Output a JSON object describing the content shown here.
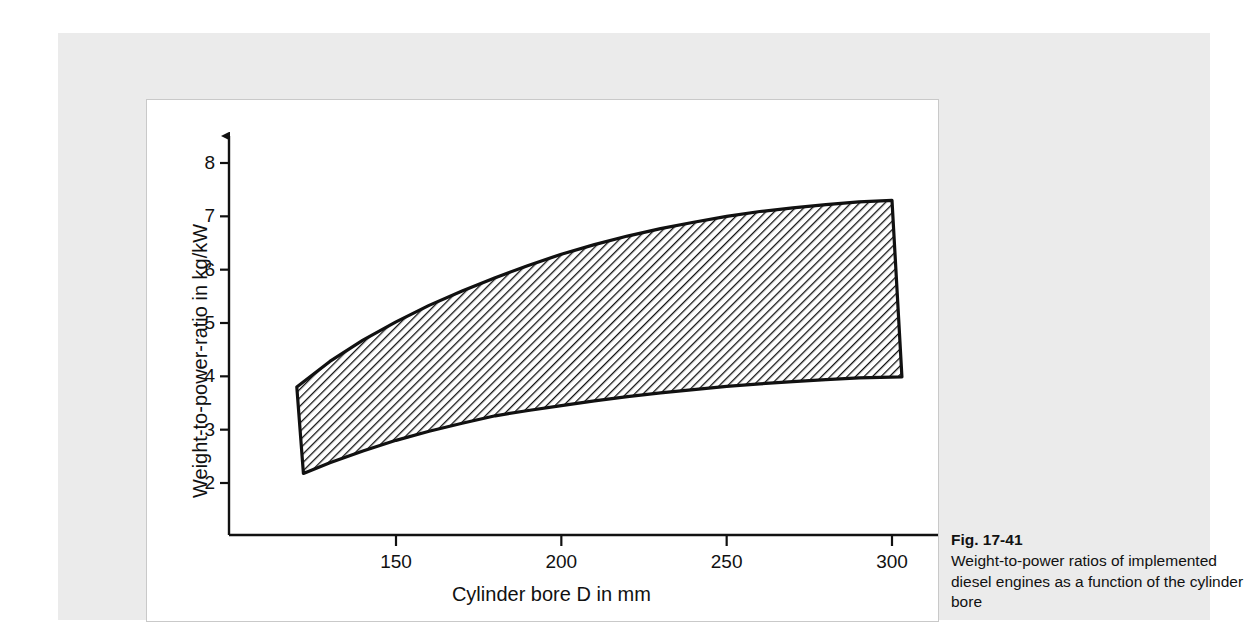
{
  "figure": {
    "number_label": "Fig. 17-41",
    "caption": "Weight-to-power ratios of implemented diesel engines as a function of the cylinder bore"
  },
  "chart_data": {
    "type": "area",
    "title": "",
    "xlabel": "Cylinder bore D in mm",
    "ylabel": "Weight-to-power-ratio in kg/kW",
    "xlim": [
      110,
      315
    ],
    "ylim": [
      1.4,
      8.6
    ],
    "x_ticks": [
      150,
      200,
      250,
      300
    ],
    "x_tick_labels": [
      "150",
      "200",
      "250",
      "300"
    ],
    "y_ticks": [
      2,
      3,
      4,
      5,
      6,
      7,
      8
    ],
    "y_tick_labels": [
      "2",
      "3",
      "4",
      "5",
      "6",
      "7",
      "8"
    ],
    "grid": false,
    "legend": "none",
    "band_label": "range of implemented diesel engines",
    "hatch": "diagonal-45",
    "series": [
      {
        "name": "upper bound",
        "x": [
          120,
          130,
          140,
          150,
          160,
          170,
          180,
          190,
          200,
          210,
          220,
          230,
          240,
          250,
          260,
          270,
          280,
          290,
          300
        ],
        "values": [
          3.8,
          4.28,
          4.68,
          5.02,
          5.33,
          5.6,
          5.85,
          6.08,
          6.29,
          6.47,
          6.63,
          6.77,
          6.89,
          7.0,
          7.09,
          7.16,
          7.22,
          7.27,
          7.3
        ]
      },
      {
        "name": "lower bound",
        "x": [
          122,
          130,
          140,
          150,
          160,
          170,
          180,
          190,
          200,
          210,
          220,
          230,
          240,
          250,
          260,
          270,
          280,
          290,
          303
        ],
        "values": [
          2.18,
          2.38,
          2.6,
          2.8,
          2.97,
          3.12,
          3.26,
          3.36,
          3.45,
          3.54,
          3.62,
          3.69,
          3.75,
          3.81,
          3.86,
          3.9,
          3.94,
          3.97,
          3.99
        ]
      }
    ]
  }
}
